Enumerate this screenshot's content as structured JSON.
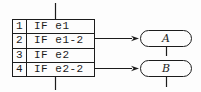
{
  "figure": {
    "table": {
      "rows": [
        {
          "num": "1",
          "label": "IF e1"
        },
        {
          "num": "2",
          "label": "IF e1-2"
        },
        {
          "num": "3",
          "label": "IF e2"
        },
        {
          "num": "4",
          "label": "IF e2-2"
        }
      ]
    },
    "nodes": [
      {
        "label": "A"
      },
      {
        "label": "B"
      }
    ],
    "colors": {
      "line": "#1c1c1c",
      "background": "#fdfdfd"
    }
  }
}
